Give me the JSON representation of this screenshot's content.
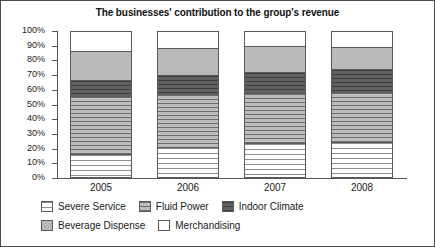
{
  "chart_data": {
    "type": "bar",
    "subtype": "stacked-100-percent",
    "title": "The businesses' contribution to the group's revenue",
    "xlabel": "",
    "ylabel": "",
    "ylim": [
      0,
      100
    ],
    "grid": false,
    "legend_position": "bottom",
    "categories": [
      "2005",
      "2006",
      "2007",
      "2008"
    ],
    "ytick_labels": [
      "100%",
      "90%",
      "80%",
      "70%",
      "60%",
      "50%",
      "40%",
      "30%",
      "20%",
      "10%",
      "0%"
    ],
    "ytick_values": [
      100,
      90,
      80,
      70,
      60,
      50,
      40,
      30,
      20,
      10,
      0
    ],
    "series": [
      {
        "name": "Severe Service",
        "pattern": "white-horizontal-lines",
        "color": "#ffffff",
        "values": [
          15.0,
          20.0,
          22.5,
          23.5
        ]
      },
      {
        "name": "Fluid Power",
        "pattern": "gray-horizontal-lines",
        "color": "#c9c9c9",
        "values": [
          40.0,
          36.5,
          34.5,
          34.5
        ]
      },
      {
        "name": "Indoor Climate",
        "pattern": "dark-solid",
        "color": "#5d5d5d",
        "values": [
          11.0,
          13.5,
          15.0,
          15.5
        ]
      },
      {
        "name": "Beverage Dispense",
        "pattern": "solid-gray",
        "color": "#b9b9b9",
        "values": [
          20.5,
          18.0,
          17.5,
          15.5
        ]
      },
      {
        "name": "Merchandising",
        "pattern": "solid-white",
        "color": "#ffffff",
        "values": [
          13.5,
          12.0,
          10.5,
          11.0
        ]
      }
    ],
    "cumulative_tops": {
      "2005": [
        15.0,
        55.0,
        66.0,
        86.5,
        100.0
      ],
      "2006": [
        20.0,
        56.5,
        70.0,
        88.0,
        100.0
      ],
      "2007": [
        22.5,
        57.0,
        72.0,
        89.5,
        100.0
      ],
      "2008": [
        23.5,
        58.0,
        73.5,
        89.0,
        100.0
      ]
    }
  },
  "legend": {
    "row1": [
      {
        "label": "Severe Service"
      },
      {
        "label": "Fluid Power"
      },
      {
        "label": "Indoor Climate"
      }
    ],
    "row2": [
      {
        "label": "Beverage Dispense"
      },
      {
        "label": "Merchandising"
      }
    ]
  }
}
